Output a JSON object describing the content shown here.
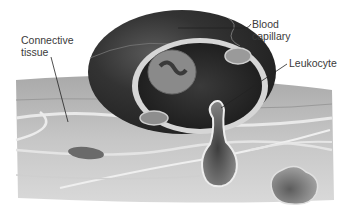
{
  "diagram": {
    "style": "grayscale illustration",
    "labels": [
      {
        "id": "connective_tissue",
        "text": "Connective\ntissue"
      },
      {
        "id": "blood_capillary",
        "text": "Blood\ncapillary"
      },
      {
        "id": "leukocyte",
        "text": "Leukocyte"
      }
    ]
  },
  "labels": {
    "connective_tissue": "Connective\ntissue",
    "blood_capillary": "Blood\ncapillary",
    "leukocyte": "Leukocyte"
  },
  "colors": {
    "capillary_dark": "#2a2a2a",
    "capillary_wall": "#d8d8d8",
    "tissue": "#bdbdbd",
    "fibers": "#e6e6e6",
    "text": "#3a3a3a"
  }
}
